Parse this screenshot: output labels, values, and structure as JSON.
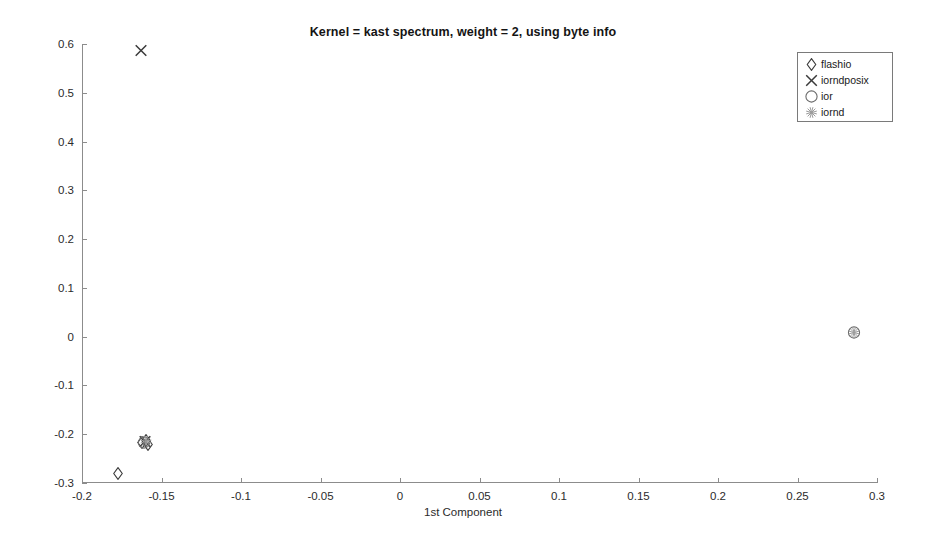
{
  "chart_data": {
    "type": "scatter",
    "title": "Kernel = kast spectrum, weight = 2, using byte info",
    "xlabel": "1st Component",
    "ylabel": "2nd Component",
    "xlim": [
      -0.2,
      0.3
    ],
    "ylim": [
      -0.3,
      0.6
    ],
    "xticks": [
      -0.2,
      -0.15,
      -0.1,
      -0.05,
      0,
      0.05,
      0.1,
      0.15,
      0.2,
      0.25,
      0.3
    ],
    "xticklabels": [
      "-0.2",
      "-0.15",
      "-0.1",
      "-0.05",
      "0",
      "0.05",
      "0.1",
      "0.15",
      "0.2",
      "0.25",
      "0.3"
    ],
    "yticks": [
      -0.3,
      -0.2,
      -0.1,
      0,
      0.1,
      0.2,
      0.3,
      0.4,
      0.5,
      0.6
    ],
    "yticklabels": [
      "-0.3",
      "-0.2",
      "-0.1",
      "0",
      "0.1",
      "0.2",
      "0.3",
      "0.4",
      "0.5",
      "0.6"
    ],
    "grid": false,
    "legend_position": "top-right",
    "series": [
      {
        "name": "flashio",
        "marker": "diamond",
        "color": "#3a3a3a",
        "points": [
          {
            "x": -0.1775,
            "y": -0.2835
          },
          {
            "x": -0.1625,
            "y": -0.2195
          },
          {
            "x": -0.16,
            "y": -0.2165
          },
          {
            "x": -0.1585,
            "y": -0.2235
          }
        ]
      },
      {
        "name": "iorndposix",
        "marker": "cross",
        "color": "#3a3a3a",
        "points": [
          {
            "x": -0.163,
            "y": 0.583
          },
          {
            "x": -0.1605,
            "y": -0.219
          }
        ]
      },
      {
        "name": "ior",
        "marker": "circle",
        "color": "#6b6b6b",
        "points": [
          {
            "x": 0.2855,
            "y": 0.0055
          },
          {
            "x": -0.161,
            "y": -0.221
          }
        ]
      },
      {
        "name": "iornd",
        "marker": "asterisk",
        "color": "#9a9a9a",
        "points": [
          {
            "x": 0.2855,
            "y": 0.005
          },
          {
            "x": -0.1595,
            "y": -0.218
          }
        ]
      }
    ]
  },
  "legend": {
    "items": [
      {
        "label": "flashio",
        "marker": "diamond"
      },
      {
        "label": "iorndposix",
        "marker": "cross"
      },
      {
        "label": "ior",
        "marker": "circle"
      },
      {
        "label": "iornd",
        "marker": "asterisk"
      }
    ]
  }
}
